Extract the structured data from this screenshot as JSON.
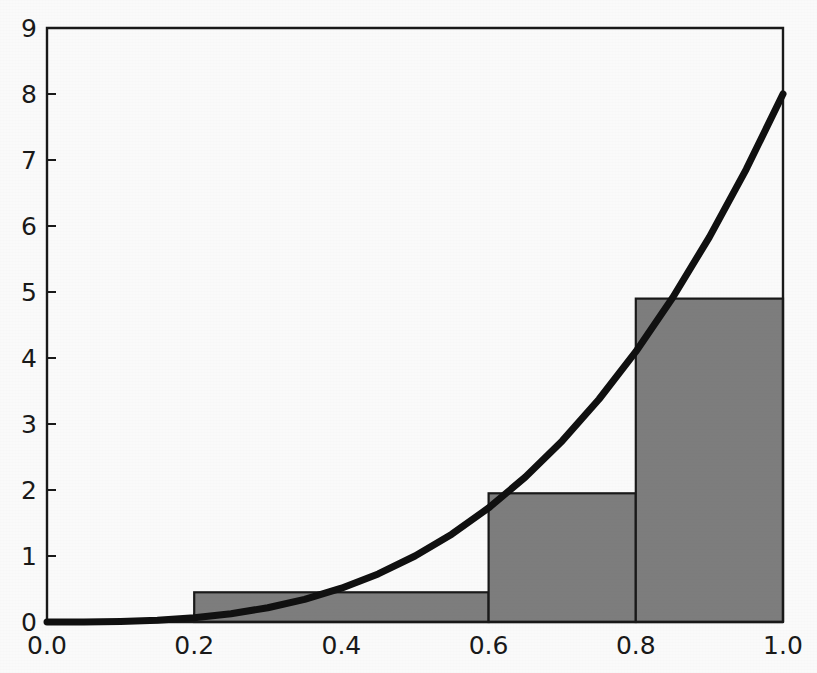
{
  "chart_data": {
    "type": "bar",
    "title": "",
    "subtitle": "",
    "xlabel": "",
    "ylabel": "",
    "xlim": [
      0.0,
      1.0
    ],
    "ylim": [
      0,
      9
    ],
    "grid": false,
    "legend": null,
    "x_ticks": [
      0.0,
      0.2,
      0.4,
      0.6,
      0.8,
      1.0
    ],
    "x_tick_labels": [
      "0.0",
      "0.2",
      "0.4",
      "0.6",
      "0.8",
      "1.0"
    ],
    "y_ticks": [
      0,
      1,
      2,
      3,
      4,
      5,
      6,
      7,
      8,
      9
    ],
    "y_tick_labels": [
      "0",
      "1",
      "2",
      "3",
      "4",
      "5",
      "6",
      "7",
      "8",
      "9"
    ],
    "bars": [
      {
        "x_start": 0.2,
        "x_end": 0.6,
        "height": 0.45
      },
      {
        "x_start": 0.6,
        "x_end": 0.8,
        "height": 1.95
      },
      {
        "x_start": 0.8,
        "x_end": 1.0,
        "height": 4.9
      }
    ],
    "bar_fill_color": "#808080",
    "bar_edge_color": "#1a1a1a",
    "series": [
      {
        "name": "curve",
        "type": "line",
        "color": "#111111",
        "line_width": 7,
        "x": [
          0.0,
          0.05,
          0.1,
          0.15,
          0.2,
          0.25,
          0.3,
          0.35,
          0.4,
          0.45,
          0.5,
          0.55,
          0.6,
          0.65,
          0.7,
          0.75,
          0.8,
          0.85,
          0.9,
          0.95,
          1.0
        ],
        "values": [
          0.0,
          0.001,
          0.008,
          0.027,
          0.064,
          0.125,
          0.216,
          0.343,
          0.512,
          0.729,
          1.0,
          1.331,
          1.728,
          2.197,
          2.744,
          3.375,
          4.096,
          4.913,
          5.832,
          6.859,
          8.0
        ]
      }
    ]
  },
  "axes": {
    "frame_color": "#1a1a1a",
    "tick_color": "#1a1a1a"
  }
}
